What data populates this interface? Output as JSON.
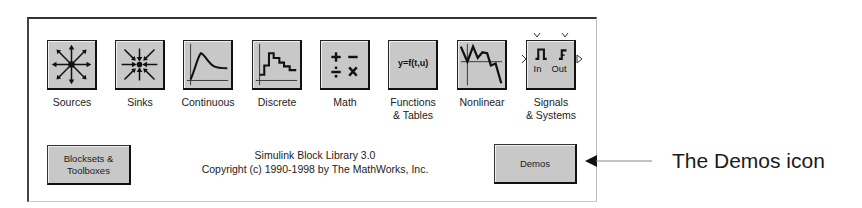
{
  "library": {
    "title": "Simulink Block Library 3.0",
    "copyright": "Copyright (c) 1990-1998 by The MathWorks, Inc.",
    "blocks": [
      {
        "label": "Sources",
        "icon": "sources-icon"
      },
      {
        "label": "Sinks",
        "icon": "sinks-icon"
      },
      {
        "label": "Continuous",
        "icon": "continuous-icon"
      },
      {
        "label": "Discrete",
        "icon": "discrete-icon"
      },
      {
        "label": "Math",
        "icon": "math-icon"
      },
      {
        "label": "Functions\n& Tables",
        "label_line1": "Functions",
        "label_line2": "& Tables",
        "icon": "functions-tables-icon",
        "icon_text": "y=f(t,u)"
      },
      {
        "label": "Nonlinear",
        "icon": "nonlinear-icon"
      },
      {
        "label": "Signals\n& Systems",
        "label_line1": "Signals",
        "label_line2": "& Systems",
        "icon": "signals-systems-icon",
        "port_in": "In",
        "port_out": "Out"
      }
    ],
    "buttons": {
      "blocksets_line1": "Blocksets &",
      "blocksets_line2": "Toolboxes",
      "demos": "Demos"
    }
  },
  "annotation": {
    "text": "The Demos icon",
    "arrow": "left-arrow"
  }
}
